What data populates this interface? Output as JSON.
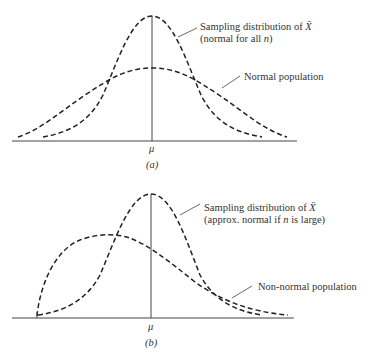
{
  "panel_a": {
    "caption": "(a)",
    "mean_label": "μ",
    "sampling_label_line1_prefix": "Sampling distribution of ",
    "xbar": "X̄",
    "sampling_label_line2_prefix": "(normal for all ",
    "n": "n",
    "sampling_label_line2_suffix": ")",
    "population_label": "Normal population"
  },
  "panel_b": {
    "caption": "(b)",
    "mean_label": "μ",
    "sampling_label_line1_prefix": "Sampling distribution of ",
    "xbar": "X̄",
    "sampling_label_line2_prefix": "(approx. normal if ",
    "n": "n",
    "sampling_label_line2_suffix": " is large)",
    "population_label": "Non-normal population"
  },
  "colors": {
    "curve": "#222222",
    "text": "#333333",
    "background": "#ffffff"
  }
}
